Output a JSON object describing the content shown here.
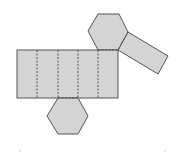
{
  "diagram": {
    "type": "net",
    "colors": {
      "face_fill": "#d4d4d4",
      "outline": "#555555",
      "background": "#ffffff"
    },
    "lateral_faces_count": 6,
    "hexagon_faces_count": 2
  }
}
